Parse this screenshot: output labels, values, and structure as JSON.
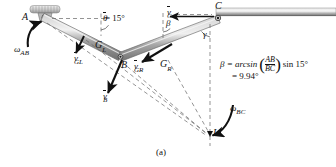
{
  "figure": {
    "caption": "(a)",
    "points": {
      "A": "A",
      "B": "B",
      "C": "C",
      "I": "I",
      "GL": "G",
      "GL_sub": "L",
      "GR": "G",
      "GR_sub": "R"
    },
    "angles": {
      "theta": "θ = 15°",
      "theta_symbol": "θ",
      "theta_value": "= 15°",
      "beta": "β",
      "gamma": "γ"
    },
    "vectors": {
      "v_C": {
        "name": "v",
        "sub": "C"
      },
      "v_B": {
        "name": "v",
        "sub": "B"
      },
      "v_GL": {
        "name": "v",
        "sub": "GL"
      },
      "v_GR": {
        "name": "v",
        "sub": "GR"
      }
    },
    "omegas": {
      "omega_AB": {
        "name": "ω",
        "sub": "AB"
      },
      "omega_BC": {
        "name": "ω",
        "sub": "BC"
      }
    },
    "equation": {
      "lhs": "β = arcsin",
      "frac_num": "AB",
      "frac_den": "BC",
      "rhs": "sin 15°",
      "result": "= 9.94°"
    },
    "colors": {
      "link": "#8d8d8d",
      "link_dark": "#5a5a5a",
      "ink": "#111111",
      "dashed": "#6b6b6b",
      "hatch": "#9a9a9a"
    }
  }
}
